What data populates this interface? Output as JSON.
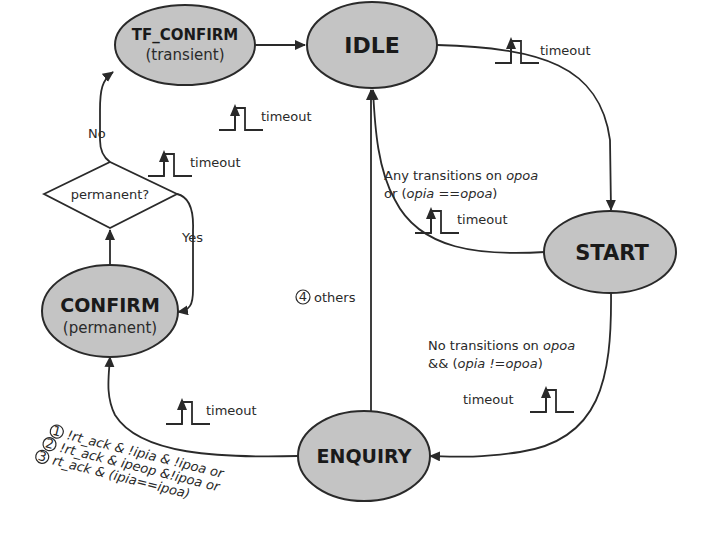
{
  "states": {
    "tf_confirm": {
      "label": "TF_CONFIRM",
      "sublabel": "(transient)"
    },
    "idle": {
      "label": "IDLE"
    },
    "start": {
      "label": "START"
    },
    "enquiry": {
      "label": "ENQUIRY"
    },
    "confirm": {
      "label": "CONFIRM",
      "sublabel": "(permanent)"
    }
  },
  "decision": {
    "label": "permanent?",
    "no_label": "No",
    "yes_label": "Yes"
  },
  "transitions": {
    "tf_confirm_to_idle": {
      "label": "timeout"
    },
    "idle_to_start": {
      "label": "timeout"
    },
    "confirm_to_decision": {
      "label": "timeout"
    },
    "start_to_idle": {
      "line1_a": "Any transitions on ",
      "line1_b": "opoa",
      "line2_a": "or (",
      "line2_b": "opia ==opoa",
      "line2_c": ")",
      "label": "timeout"
    },
    "start_to_enquiry": {
      "line1_a": "No transitions on ",
      "line1_b": "opoa",
      "line2_a": "&& (",
      "line2_b": "opia !=opoa",
      "line2_c": ")",
      "label": "timeout"
    },
    "enquiry_to_idle": {
      "num": "4",
      "label": "others"
    },
    "enquiry_to_confirm": {
      "label": "timeout",
      "conditions": [
        {
          "num": "1",
          "text": "!rt_ack & !ipia & !ipoa or"
        },
        {
          "num": "2",
          "text": "!rt_ack & ipeop &!ipoa or"
        },
        {
          "num": "3",
          "text": "rt_ack & (ipia==ipoa)"
        }
      ]
    }
  },
  "colors": {
    "state_fill": "#c4c4c4",
    "stroke": "#2a2a2a",
    "background": "#ffffff"
  }
}
